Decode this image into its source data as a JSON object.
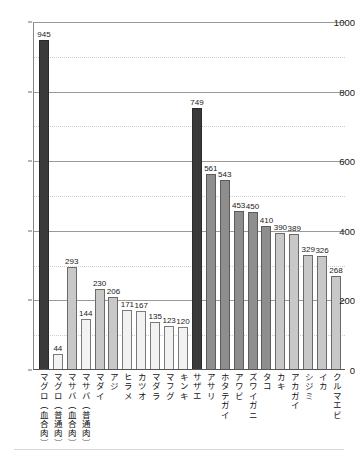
{
  "chart_data": {
    "type": "bar",
    "title": "",
    "subtitle": "",
    "xlabel": "",
    "ylabel": "",
    "ylim": [
      0,
      1000
    ],
    "yticks": [
      0,
      200,
      400,
      600,
      800,
      1000
    ],
    "ytick_labels": [
      "0",
      "200",
      "400",
      "600",
      "800",
      "1000"
    ],
    "minor_yticks": [
      100,
      300,
      500,
      700,
      900
    ],
    "grid": "horizontal-major-solid-minor-dotted",
    "legend": "none",
    "categories": [
      "マグロ（血合肉）",
      "マグロ（普通肉）",
      "マサバ（血合肉）",
      "マサバ（普通肉）",
      "マダイ",
      "アジ",
      "ヒラメ",
      "カツオ",
      "マダラ",
      "マフグ",
      "キンキ",
      "サザエ",
      "アサリ",
      "ホタテガイ",
      "アワビ",
      "ズワイガニ",
      "タコ",
      "カキ",
      "アカガイ",
      "シジミ",
      "イカ",
      "クルマエビ"
    ],
    "values": [
      945,
      44,
      293,
      144,
      230,
      206,
      171,
      167,
      135,
      123,
      120,
      749,
      561,
      543,
      453,
      450,
      410,
      390,
      389,
      329,
      326,
      268
    ],
    "value_labels": [
      "945",
      "44",
      "293",
      "144",
      "230",
      "206",
      "171",
      "167",
      "135",
      "123",
      "120",
      "749",
      "561",
      "543",
      "453",
      "450",
      "410",
      "390",
      "389",
      "329",
      "326",
      "268"
    ],
    "bar_shades": [
      "dark",
      "pale",
      "light",
      "pale",
      "light",
      "light",
      "pale",
      "pale",
      "pale",
      "pale",
      "pale",
      "dark",
      "mid",
      "mid",
      "mid",
      "mid",
      "mid",
      "light",
      "light",
      "light",
      "light",
      "light"
    ],
    "colors": {
      "dark": "#3a3a3a",
      "mid": "#8e8e8e",
      "light": "#c8c8c8",
      "pale": "#f2f2f2",
      "axis": "#555555",
      "gridline_major": "#9a9a9a",
      "gridline_minor": "#cfcfcf",
      "text": "#1a1a1a"
    }
  }
}
